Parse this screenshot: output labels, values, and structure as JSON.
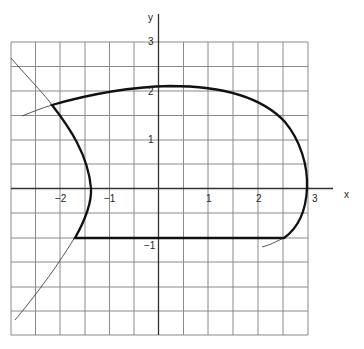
{
  "axes": {
    "x_label": "x",
    "y_label": "y",
    "x_ticks": [
      {
        "value": -2,
        "label": "−2"
      },
      {
        "value": -1,
        "label": "−1"
      },
      {
        "value": 1,
        "label": "1"
      },
      {
        "value": 2,
        "label": "2"
      },
      {
        "value": 3,
        "label": "3"
      }
    ],
    "y_ticks": [
      {
        "value": 3,
        "label": "3"
      },
      {
        "value": 2,
        "label": "2"
      },
      {
        "value": 1,
        "label": "1"
      },
      {
        "value": -1,
        "label": "−1"
      }
    ],
    "grid_step": 0.5,
    "x_range": [
      -3,
      3
    ],
    "y_range": [
      -3,
      3
    ]
  },
  "curves": {
    "boundary": "closed region bounded by a top arc (y≈2.1 near x=0), a right arc through (3,0), a horizontal bottom segment at y=−1 from x≈−1.6 to x≈2.6, and a left arc through (−1.4,0)",
    "construction_lines": "thin extensions of the left arc (from top-left to bottom-left), the top arc (toward the left), and the bottom-right arc"
  },
  "colors": {
    "grid": "#8a8a8a",
    "axis": "#333333",
    "curve": "#111111",
    "background": "#ffffff"
  }
}
